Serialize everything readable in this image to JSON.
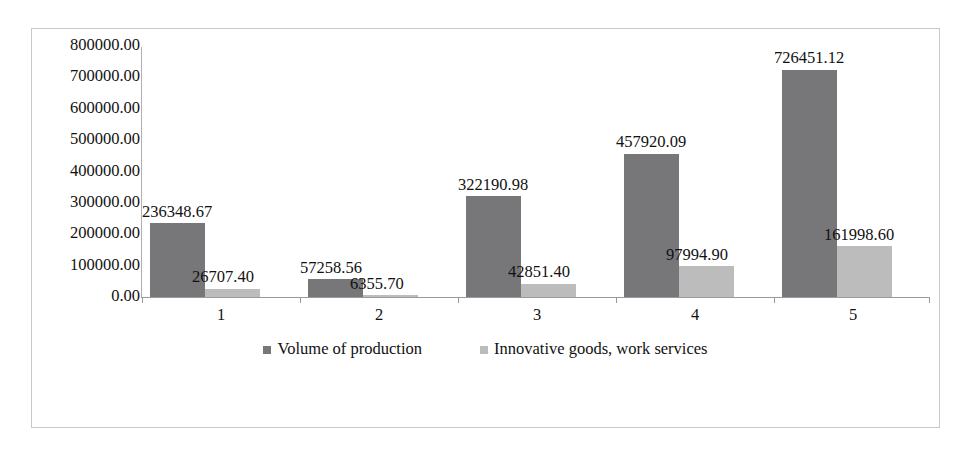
{
  "chart_data": {
    "type": "bar",
    "title": "",
    "xlabel": "",
    "ylabel": "",
    "categories": [
      "1",
      "2",
      "3",
      "4",
      "5"
    ],
    "ylim": [
      0,
      800000
    ],
    "ytick_labels": [
      "800000.00",
      "700000.00",
      "600000.00",
      "500000.00",
      "400000.00",
      "300000.00",
      "200000.00",
      "100000.00",
      "0.00"
    ],
    "ytick_values": [
      800000,
      700000,
      600000,
      500000,
      400000,
      300000,
      200000,
      100000,
      0
    ],
    "grid": false,
    "legend_position": "bottom",
    "series": [
      {
        "name": "Volume of production",
        "color": "#77777a",
        "values": [
          236348.67,
          322190.98,
          457920.09,
          726451.12,
          57258.56
        ],
        "values_by_category": [
          236348.67,
          57258.56,
          322190.98,
          457920.09,
          726451.12
        ],
        "labels": [
          "236348.67",
          "57258.56",
          "322190.98",
          "457920.09",
          "726451.12"
        ]
      },
      {
        "name": "Innovative goods, work services",
        "color": "#bcbcbc",
        "values_by_category": [
          26707.4,
          6355.7,
          42851.4,
          97994.9,
          161998.6
        ],
        "labels": [
          "26707.40",
          "6355.70",
          "42851.40",
          "97994.90",
          "161998.60"
        ]
      }
    ]
  },
  "legend": {
    "items": [
      {
        "label": "Volume of production"
      },
      {
        "label": "Innovative goods, work services"
      }
    ]
  },
  "colors": {
    "series_dark": "#77777a",
    "series_light": "#bcbcbc",
    "frame_border": "#c8c8c8",
    "axis": "#9a9a9a",
    "text": "#111111",
    "background": "#ffffff"
  }
}
